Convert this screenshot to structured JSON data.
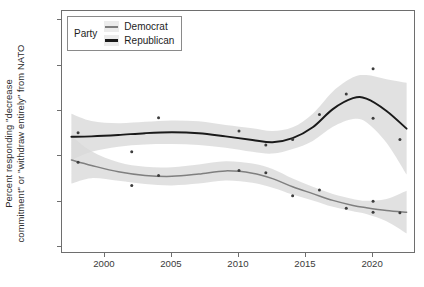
{
  "axes": {
    "ylabel": "Percent responding \"decrease\ncommitment\" or \"withdraw entirely\" from NATO",
    "xlabel": "",
    "yticks": [
      "0",
      "10",
      "20",
      "30",
      "40",
      "50"
    ],
    "xticks": [
      "2000",
      "2005",
      "2010",
      "2015",
      "2020"
    ]
  },
  "legend": {
    "title": "Party",
    "items": [
      {
        "label": "Democrat",
        "color": "#7f7f7f"
      },
      {
        "label": "Republican",
        "color": "#1a1a1a"
      }
    ]
  },
  "colors": {
    "democrat_line": "#7f7f7f",
    "republican_line": "#1a1a1a",
    "ribbon": "#d9d9d9",
    "panel_border": "#6e6e6e",
    "point": "#3d3d3d",
    "background": "#ffffff"
  },
  "chart_data": {
    "type": "line",
    "title": "",
    "xlabel": "",
    "ylabel": "Percent responding \"decrease commitment\" or \"withdraw entirely\" from NATO",
    "xlim": [
      1996.8,
      2023.2
    ],
    "ylim": [
      -1.5,
      52
    ],
    "grid": false,
    "legend_position": "top-left",
    "legend_title": "Party",
    "smoother": "loess with 95% confidence ribbon",
    "series": [
      {
        "name": "Republican",
        "color": "#1a1a1a",
        "points": {
          "x": [
            1998,
            2002,
            2004,
            2010,
            2012,
            2014,
            2016,
            2018,
            2020,
            2020,
            2022
          ],
          "y": [
            25.2,
            21.0,
            28.5,
            25.6,
            22.5,
            23.7,
            29.2,
            33.7,
            39.3,
            28.4,
            23.7
          ]
        },
        "fit": {
          "x": [
            1997.5,
            1999,
            2001,
            2003,
            2005,
            2007,
            2009,
            2011,
            2012.5,
            2014,
            2015.5,
            2017,
            2018.5,
            2019.5,
            2021,
            2022.5
          ],
          "y": [
            24.3,
            24.4,
            24.7,
            25.1,
            25.3,
            25.1,
            24.4,
            23.6,
            23.1,
            24.0,
            26.4,
            30.4,
            32.8,
            32.7,
            30.0,
            26.1
          ]
        },
        "ribbon": {
          "x": [
            1997.5,
            1999,
            2001,
            2003,
            2005,
            2007,
            2009,
            2011,
            2012.5,
            2014,
            2015.5,
            2017,
            2018.5,
            2019.5,
            2021,
            2022.5
          ],
          "lo": [
            19.2,
            21.0,
            22.1,
            22.6,
            22.7,
            22.5,
            21.9,
            21.0,
            20.6,
            21.6,
            23.4,
            26.5,
            28.2,
            27.5,
            23.0,
            16.0
          ],
          "hi": [
            29.4,
            27.8,
            27.3,
            27.6,
            27.9,
            27.7,
            26.9,
            26.2,
            25.6,
            26.4,
            29.4,
            34.3,
            37.4,
            37.9,
            37.0,
            36.2
          ]
        }
      },
      {
        "name": "Democrat",
        "color": "#7f7f7f",
        "points": {
          "x": [
            1998,
            2002,
            2004,
            2010,
            2012,
            2014,
            2016,
            2018,
            2020,
            2020,
            2022
          ],
          "y": [
            18.7,
            13.6,
            15.8,
            16.9,
            16.4,
            11.3,
            12.6,
            8.6,
            10.1,
            7.7,
            7.6
          ]
        },
        "fit": {
          "x": [
            1997.5,
            1999,
            2001,
            2003,
            2005,
            2007,
            2009,
            2011,
            2012.5,
            2014,
            2015.5,
            2017,
            2018.5,
            2019.5,
            2021,
            2022.5
          ],
          "y": [
            19.2,
            18.0,
            16.6,
            15.8,
            15.6,
            16.1,
            16.8,
            16.3,
            15.1,
            13.3,
            11.8,
            10.3,
            9.2,
            8.7,
            8.1,
            7.7
          ]
        },
        "ribbon": {
          "x": [
            1997.5,
            1999,
            2001,
            2003,
            2005,
            2007,
            2009,
            2011,
            2012.5,
            2014,
            2015.5,
            2017,
            2018.5,
            2019.5,
            2021,
            2022.5
          ],
          "lo": [
            14.0,
            15.2,
            14.6,
            13.9,
            13.6,
            14.0,
            14.7,
            14.2,
            13.1,
            11.6,
            10.3,
            8.9,
            7.9,
            7.3,
            5.7,
            3.0
          ],
          "hi": [
            24.5,
            21.1,
            18.7,
            17.7,
            17.6,
            18.2,
            18.9,
            18.4,
            17.2,
            15.1,
            13.3,
            11.7,
            10.6,
            10.2,
            10.6,
            12.4
          ]
        }
      }
    ]
  }
}
